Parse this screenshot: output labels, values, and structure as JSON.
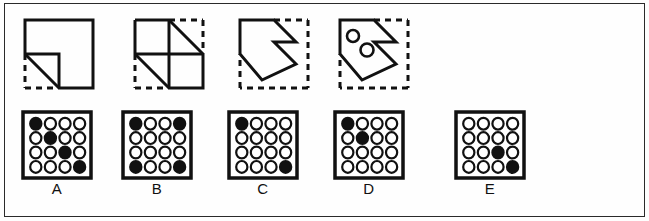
{
  "page": {
    "background_color": "#fefefe",
    "border_color": "#2a2a2a",
    "width": 649,
    "height": 221
  },
  "colors": {
    "ink": "#111111",
    "filled_circle": "#111111",
    "open_circle": "#ffffff",
    "stroke": "#111111"
  },
  "stimulus": {
    "description": "Sequence of four paper-folding / shape-transformation figures",
    "figures": [
      {
        "id": "figure-1",
        "name": "square-with-notched-corner",
        "solid_edges": [
          "top",
          "right",
          "left-upper"
        ],
        "dashed_edges": [
          "bottom-left",
          "left-lower"
        ],
        "has_diagonal": true,
        "inner_circles": 0
      },
      {
        "id": "figure-2",
        "name": "quartered-square-two-diagonals",
        "solid_edges": [
          "top",
          "left"
        ],
        "dashed_edges": [
          "right",
          "bottom"
        ],
        "has_diagonal": true,
        "inner_circles": 0
      },
      {
        "id": "figure-3",
        "name": "pentagon-arrow-in-dashed-square",
        "solid_edges": [],
        "dashed_edges": [
          "top-right",
          "right",
          "bottom",
          "left-lower"
        ],
        "has_diagonal": false,
        "inner_circles": 0
      },
      {
        "id": "figure-4",
        "name": "pentagon-arrow-with-two-holes",
        "solid_edges": [],
        "dashed_edges": [
          "top-right",
          "right",
          "bottom",
          "left-lower"
        ],
        "has_diagonal": false,
        "inner_circles": 2
      }
    ]
  },
  "options": {
    "grid_size": 4,
    "items": [
      {
        "label": "A",
        "name": "option-a",
        "grid": [
          [
            1,
            0,
            0,
            0
          ],
          [
            0,
            1,
            0,
            0
          ],
          [
            0,
            0,
            1,
            0
          ],
          [
            0,
            0,
            0,
            1
          ]
        ]
      },
      {
        "label": "B",
        "name": "option-b",
        "grid": [
          [
            1,
            0,
            0,
            1
          ],
          [
            0,
            0,
            0,
            0
          ],
          [
            0,
            0,
            0,
            0
          ],
          [
            1,
            0,
            0,
            1
          ]
        ]
      },
      {
        "label": "C",
        "name": "option-c",
        "grid": [
          [
            1,
            0,
            0,
            0
          ],
          [
            0,
            0,
            0,
            0
          ],
          [
            0,
            0,
            0,
            0
          ],
          [
            0,
            0,
            0,
            1
          ]
        ]
      },
      {
        "label": "D",
        "name": "option-d",
        "grid": [
          [
            1,
            0,
            0,
            0
          ],
          [
            0,
            1,
            0,
            0
          ],
          [
            0,
            0,
            0,
            0
          ],
          [
            0,
            0,
            0,
            0
          ]
        ]
      },
      {
        "label": "E",
        "name": "option-e",
        "grid": [
          [
            0,
            0,
            0,
            0
          ],
          [
            0,
            0,
            0,
            0
          ],
          [
            0,
            0,
            1,
            0
          ],
          [
            0,
            0,
            0,
            1
          ]
        ]
      }
    ]
  }
}
